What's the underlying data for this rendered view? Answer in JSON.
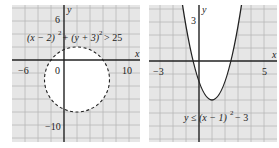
{
  "figures": [
    {
      "id": "left",
      "inequality": "(x − 2)² + (y + 3)² > 25",
      "inequality_parts": {
        "a": "(x − 2)",
        "b": "+ (y + 3)",
        "c": "> 25",
        "exp": "2"
      },
      "axis_labels": {
        "x": "x",
        "y": "y"
      },
      "tick_labels": {
        "x_neg": "−6",
        "origin": "0",
        "x_pos": "10",
        "y_pos": "6",
        "y_neg": "−10"
      },
      "boundary": "dashed circle",
      "center": [
        2,
        -3
      ],
      "radius": 5,
      "shaded_region": "outside circle"
    },
    {
      "id": "right",
      "inequality": "y ≤ (x − 1)² − 3",
      "inequality_parts": {
        "a": "y ≤ (x − 1)",
        "exp": "2",
        "c": "− 3"
      },
      "axis_labels": {
        "x": "x",
        "y": "y"
      },
      "tick_labels": {
        "x_neg": "−3",
        "x_pos": "5",
        "y_pos": "3"
      },
      "boundary": "solid parabola",
      "vertex": [
        1,
        -3
      ],
      "shaded_region": "below/outside parabola"
    }
  ],
  "colors": {
    "shade": "#e6e6e6",
    "grid": "#b8b8b8",
    "axis": "#222222",
    "curve": "#222222"
  }
}
